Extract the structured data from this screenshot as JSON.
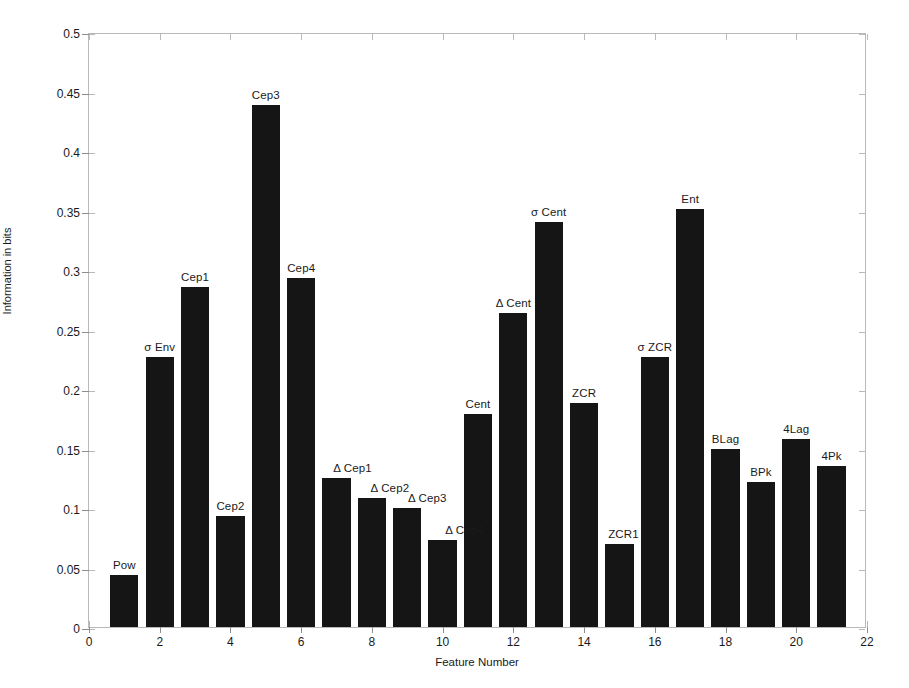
{
  "chart_data": {
    "type": "bar",
    "title": "",
    "xlabel": "Feature Number",
    "ylabel": "Information in bits",
    "xlim": [
      0,
      22
    ],
    "ylim": [
      0,
      0.5
    ],
    "grid": false,
    "legend": null,
    "x_tick_labels": [
      "0",
      "2",
      "4",
      "6",
      "8",
      "10",
      "12",
      "14",
      "16",
      "18",
      "20",
      "22"
    ],
    "x_tick_values": [
      0,
      2,
      4,
      6,
      8,
      10,
      12,
      14,
      16,
      18,
      20,
      22
    ],
    "y_tick_labels": [
      "0",
      "0.05",
      "0.1",
      "0.15",
      "0.2",
      "0.25",
      "0.3",
      "0.35",
      "0.4",
      "0.45",
      "0.5"
    ],
    "y_tick_values": [
      0,
      0.05,
      0.1,
      0.15,
      0.2,
      0.25,
      0.3,
      0.35,
      0.4,
      0.45,
      0.5
    ],
    "bar_color": "#151515",
    "bar_width": 0.8,
    "x": [
      1,
      2,
      3,
      4,
      5,
      6,
      7,
      8,
      9,
      10,
      11,
      12,
      13,
      14,
      15,
      16,
      17,
      18,
      19,
      20,
      21
    ],
    "categories": [
      "Pow",
      "σ Env",
      "Cep1",
      "Cep2",
      "Cep3",
      "Cep4",
      "Δ Cep1",
      "Δ Cep2",
      "Δ Cep3",
      "Δ Cep4",
      "Cent",
      "Δ Cent",
      "σ Cent",
      "ZCR",
      "ZCR1",
      "σ ZCR",
      "Ent",
      "BLag",
      "BPk",
      "4Lag",
      "4Pk"
    ],
    "values": [
      0.044,
      0.227,
      0.286,
      0.093,
      0.439,
      0.293,
      0.125,
      0.108,
      0.1,
      0.073,
      0.179,
      0.264,
      0.34,
      0.188,
      0.07,
      0.227,
      0.351,
      0.15,
      0.122,
      0.158,
      0.135
    ],
    "annotations": [
      {
        "label": "Pow",
        "x": 1,
        "y": 0.044
      },
      {
        "label": "σ Env",
        "x": 2,
        "y": 0.227
      },
      {
        "label": "Cep1",
        "x": 3,
        "y": 0.286
      },
      {
        "label": "Cep2",
        "x": 4,
        "y": 0.093
      },
      {
        "label": "Cep3",
        "x": 5,
        "y": 0.439
      },
      {
        "label": "Cep4",
        "x": 6,
        "y": 0.293
      },
      {
        "label": "Δ Cep1",
        "x": 7,
        "y": 0.125
      },
      {
        "label": "Δ Cep2",
        "x": 8,
        "y": 0.108
      },
      {
        "label": "Δ Cep3",
        "x": 9,
        "y": 0.1
      },
      {
        "label": "Δ Cep4",
        "x": 10,
        "y": 0.073
      },
      {
        "label": "Cent",
        "x": 11,
        "y": 0.179
      },
      {
        "label": "Δ Cent",
        "x": 12,
        "y": 0.264
      },
      {
        "label": "σ Cent",
        "x": 13,
        "y": 0.34
      },
      {
        "label": "ZCR",
        "x": 14,
        "y": 0.188
      },
      {
        "label": "ZCR1",
        "x": 15,
        "y": 0.07
      },
      {
        "label": "σ ZCR",
        "x": 16,
        "y": 0.227
      },
      {
        "label": "Ent",
        "x": 17,
        "y": 0.351
      },
      {
        "label": "BLag",
        "x": 18,
        "y": 0.15
      },
      {
        "label": "BPk",
        "x": 19,
        "y": 0.122
      },
      {
        "label": "4Lag",
        "x": 20,
        "y": 0.158
      },
      {
        "label": "4Pk",
        "x": 21,
        "y": 0.135
      }
    ],
    "label_offsets": [
      {
        "dx": 0,
        "dy": 18
      },
      {
        "dx": 0,
        "dy": 18
      },
      {
        "dx": 0,
        "dy": 18
      },
      {
        "dx": 0,
        "dy": 18
      },
      {
        "dx": 0,
        "dy": 18
      },
      {
        "dx": 0,
        "dy": 18
      },
      {
        "dx": 16,
        "dy": 18
      },
      {
        "dx": 18,
        "dy": 18
      },
      {
        "dx": 20,
        "dy": 18
      },
      {
        "dx": 22,
        "dy": 18
      },
      {
        "dx": 0,
        "dy": 18
      },
      {
        "dx": 0,
        "dy": 18
      },
      {
        "dx": 0,
        "dy": 18
      },
      {
        "dx": 0,
        "dy": 18
      },
      {
        "dx": 4,
        "dy": 18
      },
      {
        "dx": 0,
        "dy": 18
      },
      {
        "dx": 0,
        "dy": 18
      },
      {
        "dx": 0,
        "dy": 18
      },
      {
        "dx": 0,
        "dy": 18
      },
      {
        "dx": 0,
        "dy": 18
      },
      {
        "dx": 0,
        "dy": 18
      }
    ]
  }
}
